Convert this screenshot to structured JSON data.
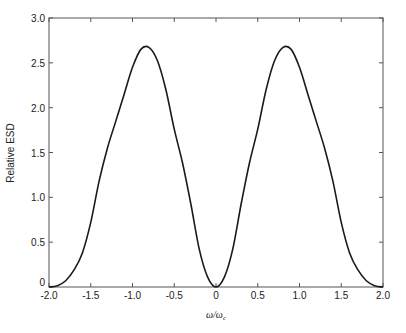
{
  "chart_data": {
    "type": "line",
    "title": "",
    "xlabel": "ω/ω_c",
    "xlabel_main": "ω/ω",
    "xlabel_sub": "c",
    "ylabel": "Relative ESD",
    "xlim": [
      -2.0,
      2.0
    ],
    "ylim": [
      0,
      3.0
    ],
    "grid": false,
    "legend": null,
    "x_ticks": [
      "-2.0",
      "-1.5",
      "-1.0",
      "-0.5",
      "0",
      "0.5",
      "1.0",
      "1.5",
      "2.0"
    ],
    "x_tick_values": [
      -2.0,
      -1.5,
      -1.0,
      -0.5,
      0,
      0.5,
      1.0,
      1.5,
      2.0
    ],
    "y_ticks": [
      "0",
      "0.5",
      "1.0",
      "1.5",
      "2.0",
      "2.5",
      "3.0"
    ],
    "y_tick_values": [
      0,
      0.5,
      1.0,
      1.5,
      2.0,
      2.5,
      3.0
    ],
    "series": [
      {
        "name": "Relative ESD",
        "color": "#1a1a1a",
        "x": [
          -2.0,
          -1.9,
          -1.8,
          -1.7,
          -1.6,
          -1.5,
          -1.4,
          -1.3,
          -1.2,
          -1.1,
          -1.0,
          -0.9,
          -0.8,
          -0.7,
          -0.6,
          -0.5,
          -0.4,
          -0.3,
          -0.2,
          -0.1,
          0,
          0.1,
          0.2,
          0.3,
          0.4,
          0.5,
          0.6,
          0.7,
          0.8,
          0.9,
          1.0,
          1.1,
          1.2,
          1.3,
          1.4,
          1.5,
          1.6,
          1.7,
          1.8,
          1.9,
          2.0
        ],
        "y": [
          0,
          0.015,
          0.07,
          0.19,
          0.38,
          0.72,
          1.18,
          1.55,
          1.85,
          2.15,
          2.45,
          2.65,
          2.67,
          2.52,
          2.2,
          1.76,
          1.38,
          0.92,
          0.42,
          0.11,
          0,
          0.11,
          0.42,
          0.92,
          1.38,
          1.76,
          2.2,
          2.52,
          2.67,
          2.65,
          2.45,
          2.15,
          1.85,
          1.55,
          1.18,
          0.72,
          0.38,
          0.19,
          0.07,
          0.015,
          0
        ]
      }
    ],
    "annotations": [
      "Peaks ≈ 2.68 at ω/ω_c ≈ ±0.84"
    ]
  }
}
